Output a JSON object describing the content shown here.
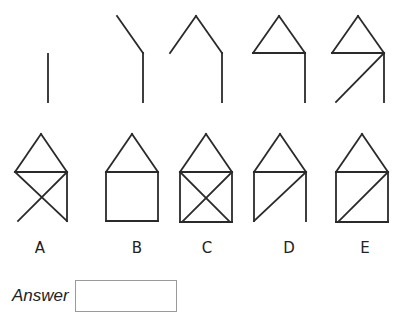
{
  "sequence": {
    "description": "Sequence of line drawings building up a house shape step by step",
    "figures": [
      {
        "id": "step-1",
        "segments": [
          [
            48,
            54,
            48,
            102
          ]
        ]
      },
      {
        "id": "step-2",
        "segments": [
          [
            117,
            16,
            143,
            53
          ],
          [
            143,
            53,
            143,
            102
          ]
        ]
      },
      {
        "id": "step-3",
        "segments": [
          [
            170,
            53,
            196,
            16
          ],
          [
            196,
            16,
            222,
            53
          ],
          [
            222,
            53,
            222,
            102
          ]
        ]
      },
      {
        "id": "step-4",
        "segments": [
          [
            253,
            53,
            279,
            16
          ],
          [
            279,
            16,
            305,
            53
          ],
          [
            253,
            53,
            305,
            53
          ],
          [
            305,
            53,
            305,
            102
          ]
        ]
      },
      {
        "id": "step-5",
        "segments": [
          [
            332,
            53,
            358,
            16
          ],
          [
            358,
            16,
            384,
            53
          ],
          [
            332,
            53,
            384,
            53
          ],
          [
            384,
            53,
            384,
            102
          ],
          [
            384,
            53,
            336,
            102
          ]
        ]
      }
    ]
  },
  "options": [
    {
      "label": "A",
      "segments": [
        [
          15,
          172,
          41,
          134
        ],
        [
          41,
          134,
          67,
          172
        ],
        [
          15,
          172,
          67,
          172
        ],
        [
          67,
          172,
          67,
          221
        ],
        [
          15,
          172,
          67,
          221
        ],
        [
          67,
          172,
          18,
          221
        ]
      ]
    },
    {
      "label": "B",
      "segments": [
        [
          106,
          172,
          132,
          134
        ],
        [
          132,
          134,
          158,
          172
        ],
        [
          106,
          172,
          158,
          172
        ],
        [
          106,
          172,
          106,
          221
        ],
        [
          158,
          172,
          158,
          221
        ],
        [
          106,
          221,
          158,
          221
        ]
      ]
    },
    {
      "label": "C",
      "segments": [
        [
          180,
          172,
          206,
          134
        ],
        [
          206,
          134,
          232,
          172
        ],
        [
          180,
          172,
          232,
          172
        ],
        [
          180,
          172,
          180,
          222
        ],
        [
          232,
          172,
          232,
          222
        ],
        [
          180,
          222,
          232,
          222
        ],
        [
          180,
          172,
          230,
          222
        ],
        [
          232,
          172,
          182,
          222
        ]
      ]
    },
    {
      "label": "D",
      "segments": [
        [
          254,
          172,
          280,
          134
        ],
        [
          280,
          134,
          306,
          172
        ],
        [
          254,
          172,
          306,
          172
        ],
        [
          254,
          172,
          254,
          221
        ],
        [
          306,
          172,
          306,
          221
        ],
        [
          306,
          172,
          254,
          221
        ]
      ]
    },
    {
      "label": "E",
      "segments": [
        [
          336,
          172,
          362,
          134
        ],
        [
          362,
          134,
          388,
          172
        ],
        [
          336,
          172,
          388,
          172
        ],
        [
          336,
          172,
          336,
          222
        ],
        [
          388,
          172,
          388,
          222
        ],
        [
          336,
          222,
          388,
          222
        ],
        [
          388,
          172,
          338,
          222
        ]
      ]
    }
  ],
  "answer": {
    "label": "Answer",
    "value": ""
  }
}
